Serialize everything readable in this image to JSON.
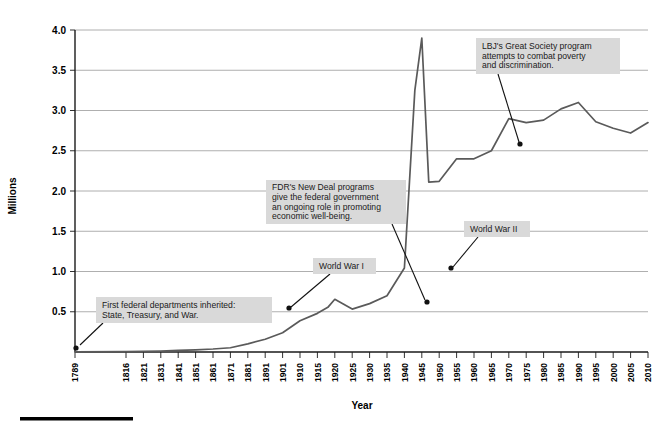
{
  "chart_data": {
    "type": "line",
    "title": "",
    "xlabel": "Year",
    "ylabel": "Millions",
    "ylim": [
      0,
      4.0
    ],
    "xlim": [
      1789,
      2010
    ],
    "grid": true,
    "legend": "none",
    "ytick_labels": [
      "0.5",
      "1.0",
      "1.5",
      "2.0",
      "2.5",
      "3.0",
      "3.5",
      "4.0"
    ],
    "ytick_values": [
      0.5,
      1.0,
      1.5,
      2.0,
      2.5,
      3.0,
      3.5,
      4.0
    ],
    "xtick_labels": [
      "1789",
      "1816",
      "1821",
      "1831",
      "1841",
      "1851",
      "1861",
      "1871",
      "1881",
      "1891",
      "1901",
      "1910",
      "1915",
      "1920",
      "1925",
      "1930",
      "1935",
      "1940",
      "1945",
      "1950",
      "1955",
      "1960",
      "1965",
      "1970",
      "1975",
      "1980",
      "1985",
      "1990",
      "1995",
      "2000",
      "2005",
      "2010"
    ],
    "series": [
      {
        "name": "Federal civilian employment",
        "color": "#5a5a5a",
        "x": [
          1789,
          1816,
          1821,
          1831,
          1841,
          1851,
          1861,
          1871,
          1881,
          1891,
          1901,
          1910,
          1915,
          1918,
          1920,
          1925,
          1930,
          1935,
          1940,
          1943,
          1945,
          1947,
          1950,
          1955,
          1960,
          1965,
          1970,
          1975,
          1980,
          1985,
          1990,
          1995,
          2000,
          2005,
          2010
        ],
        "y": [
          0.001,
          0.005,
          0.007,
          0.012,
          0.019,
          0.027,
          0.037,
          0.053,
          0.101,
          0.158,
          0.24,
          0.389,
          0.48,
          0.555,
          0.655,
          0.533,
          0.601,
          0.698,
          1.043,
          3.25,
          3.9,
          2.11,
          2.12,
          2.4,
          2.4,
          2.5,
          2.9,
          2.85,
          2.88,
          3.02,
          3.1,
          2.86,
          2.78,
          2.72,
          2.85
        ]
      }
    ],
    "annotations": [
      {
        "id": "first-federal-departments",
        "lines": [
          "First federal departments inherited:",
          "State, Treasury, and War."
        ],
        "box": {
          "x": 96,
          "y": 297,
          "w": 176,
          "h": 26
        },
        "leader": {
          "x1": 103,
          "y1": 323,
          "x2": 80,
          "y2": 345
        },
        "marker": {
          "x": 76,
          "y": 348
        }
      },
      {
        "id": "world-war-i",
        "lines": [
          "World War I"
        ],
        "box": {
          "x": 313,
          "y": 258,
          "w": 63,
          "h": 16
        },
        "leader": {
          "x1": 330,
          "y1": 274,
          "x2": 291,
          "y2": 307
        },
        "marker": {
          "x": 289,
          "y": 308
        }
      },
      {
        "id": "fdr-new-deal",
        "lines": [
          "FDR's New Deal programs",
          "give the federal government",
          "an ongoing role in promoting",
          "economic well-being."
        ],
        "box": {
          "x": 266,
          "y": 180,
          "w": 140,
          "h": 44
        },
        "leader": {
          "x1": 392,
          "y1": 224,
          "x2": 425,
          "y2": 300
        },
        "marker": {
          "x": 427,
          "y": 302
        }
      },
      {
        "id": "world-war-ii",
        "lines": [
          "World War II"
        ],
        "box": {
          "x": 464,
          "y": 221,
          "w": 66,
          "h": 16
        },
        "leader": {
          "x1": 478,
          "y1": 237,
          "x2": 453,
          "y2": 267
        },
        "marker": {
          "x": 451,
          "y": 268
        }
      },
      {
        "id": "lbj-great-society",
        "lines": [
          "LBJ's Great Society program",
          "attempts to combat poverty",
          "and discrimination."
        ],
        "box": {
          "x": 476,
          "y": 38,
          "w": 144,
          "h": 36
        },
        "leader": {
          "x1": 498,
          "y1": 74,
          "x2": 519,
          "y2": 142
        },
        "marker": {
          "x": 520,
          "y": 144
        }
      }
    ]
  },
  "axes": {
    "y_title": "Millions",
    "x_title": "Year"
  },
  "footer": {
    "rule": ""
  }
}
